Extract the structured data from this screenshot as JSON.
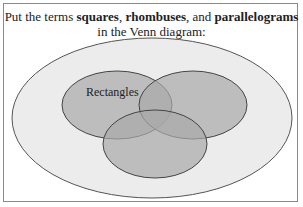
{
  "instruction": {
    "part1": "Put the terms ",
    "term1": "squares",
    "sep1": ", ",
    "term2": "rhombuses",
    "sep2": ", and ",
    "term3": "parallelograms",
    "line2": "in the Venn diagram:"
  },
  "venn": {
    "labels": {
      "rectangles": "Rectangles"
    },
    "colors": {
      "outer_fill": "#ececec",
      "circle_fill": "#a9a9a9",
      "stroke": "#555555"
    }
  }
}
